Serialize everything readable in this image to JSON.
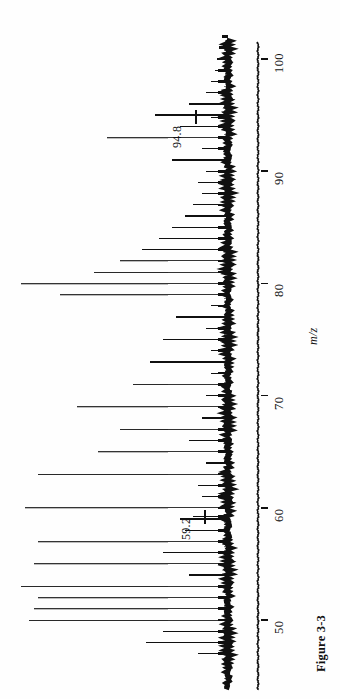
{
  "figure": {
    "caption": "Figure 3-3",
    "axis_title": "m/z",
    "orientation": "rotated-90-ccw",
    "background_color": "#fefefe",
    "trace_color": "#101010"
  },
  "axis": {
    "tick_labels": [
      "100",
      "90",
      "80",
      "70",
      "60",
      "50"
    ],
    "tick_values": [
      100,
      90,
      80,
      70,
      60,
      50
    ]
  },
  "annotations": [
    {
      "text": "94.8",
      "mz": 94.8
    },
    {
      "text": "59.2",
      "mz": 59.2
    }
  ],
  "chart_data": {
    "type": "bar",
    "title": "Figure 3-3",
    "subtitle": "",
    "xlabel": "m/z",
    "ylabel": "",
    "xlim": [
      46.5,
      103.5
    ],
    "ylim": [
      0,
      100
    ],
    "grid": false,
    "legend": null,
    "annotations": [
      {
        "text": "94.8",
        "x": 94.8,
        "y": 30
      },
      {
        "text": "59.2",
        "x": 59.2,
        "y": 30
      }
    ],
    "x": [
      47,
      48,
      49,
      50,
      51,
      52,
      53,
      54,
      55,
      56,
      57,
      58,
      59,
      59.2,
      60,
      61,
      62,
      63,
      64,
      65,
      66,
      67,
      68,
      69,
      70,
      71,
      72,
      73,
      74,
      75,
      76,
      77,
      78,
      79,
      80,
      81,
      82,
      83,
      84,
      85,
      86,
      87,
      88,
      89,
      90,
      91,
      92,
      93,
      94,
      94.8,
      95,
      96,
      97,
      98,
      99,
      100,
      101,
      102,
      103
    ],
    "values": [
      14,
      38,
      30,
      92,
      90,
      88,
      96,
      18,
      90,
      30,
      88,
      20,
      22,
      16,
      94,
      12,
      14,
      88,
      10,
      60,
      18,
      50,
      12,
      70,
      10,
      44,
      8,
      36,
      8,
      30,
      10,
      24,
      8,
      78,
      96,
      62,
      50,
      40,
      32,
      26,
      20,
      16,
      12,
      14,
      10,
      26,
      12,
      56,
      22,
      8,
      34,
      18,
      10,
      8,
      6,
      5,
      4,
      3,
      2
    ],
    "series": [
      {
        "name": "ion abundance",
        "values": [
          14,
          38,
          30,
          92,
          90,
          88,
          96,
          18,
          90,
          30,
          88,
          20,
          22,
          16,
          94,
          12,
          14,
          88,
          10,
          60,
          18,
          50,
          12,
          70,
          10,
          44,
          8,
          36,
          8,
          30,
          10,
          24,
          8,
          78,
          96,
          62,
          50,
          40,
          32,
          26,
          20,
          16,
          12,
          14,
          10,
          26,
          12,
          56,
          22,
          8,
          34,
          18,
          10,
          8,
          6,
          5,
          4,
          3,
          2
        ]
      }
    ]
  }
}
